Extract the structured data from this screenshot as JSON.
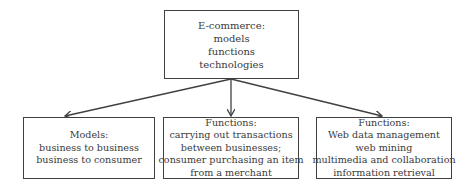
{
  "diagram": {
    "root": {
      "lines": [
        "E-commerce:",
        "models",
        "functions",
        "technologies"
      ]
    },
    "children": [
      {
        "lines": [
          "Models:",
          "business to business",
          "business to consumer"
        ]
      },
      {
        "lines": [
          "Functions:",
          "carrying out transactions",
          "between businesses;",
          "consumer purchasing an item",
          "from a merchant"
        ]
      },
      {
        "lines": [
          "Functions:",
          "Web data management",
          "web mining",
          "multimedia and collaboration",
          "information retrieval"
        ]
      }
    ],
    "edges": [
      {
        "from": "root",
        "to": "children.0"
      },
      {
        "from": "root",
        "to": "children.1"
      },
      {
        "from": "root",
        "to": "children.2"
      }
    ],
    "colors": {
      "line": "#404040",
      "text": "#3a3a3a",
      "background": "#ffffff"
    }
  }
}
